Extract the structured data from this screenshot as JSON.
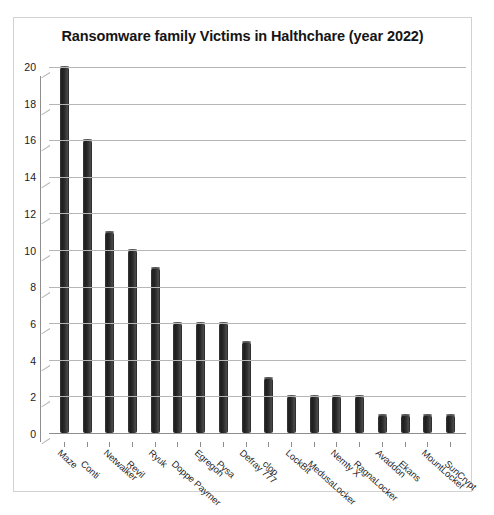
{
  "scan_header_text": "",
  "chart": {
    "title": "Ransomware family Victims in Halthchare (year 2022)"
  },
  "chart_data": {
    "type": "bar",
    "title": "Ransomware family Victims in Halthchare (year 2022)",
    "xlabel": "",
    "ylabel": "",
    "ylim": [
      0,
      20
    ],
    "yticks": [
      0,
      2,
      4,
      6,
      8,
      10,
      12,
      14,
      16,
      18,
      20
    ],
    "grid": true,
    "legend": "none",
    "bar_color": "#2b2b2b",
    "categories": [
      "Maze",
      "Conti",
      "Netwalker",
      "Revil",
      "Ryuk",
      "Doppe Paymer",
      "Egregon",
      "Pysa",
      "Defray 777",
      "clop",
      "LockBit",
      "MedusaLocker",
      "Nemty X",
      "RagnaLocker",
      "Avaddon",
      "Ekans",
      "MountLocker",
      "SunCrypt"
    ],
    "values": [
      20,
      16,
      11,
      10,
      9,
      6,
      6,
      6,
      5,
      3,
      2,
      2,
      2,
      2,
      1,
      1,
      1,
      1
    ]
  }
}
